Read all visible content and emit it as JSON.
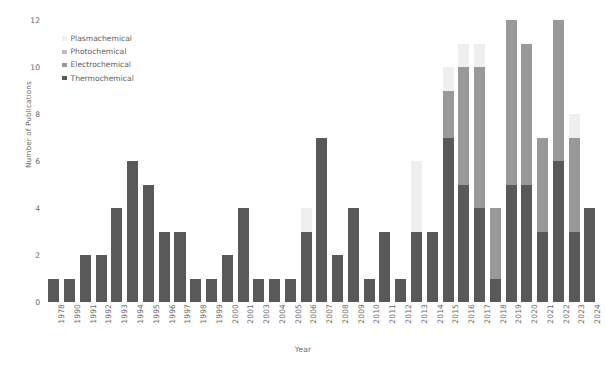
{
  "chart_data": {
    "type": "bar",
    "subtype": "stacked-vertical",
    "title": "",
    "xlabel": "Year",
    "ylabel": "Number of Publications",
    "ylim": [
      0,
      12
    ],
    "yticks": [
      0,
      2,
      4,
      6,
      8,
      10,
      12
    ],
    "grid": false,
    "legend_position": "upper-left-inside",
    "categories": [
      "1978",
      "1990",
      "1991",
      "1992",
      "1993",
      "1994",
      "1995",
      "1996",
      "1997",
      "1998",
      "1999",
      "2000",
      "2001",
      "2003",
      "2004",
      "2005",
      "2006",
      "2007",
      "2008",
      "2009",
      "2010",
      "2011",
      "2012",
      "2013",
      "2014",
      "2015",
      "2016",
      "2017",
      "2018",
      "2019",
      "2020",
      "2021",
      "2022",
      "2023",
      "2024"
    ],
    "series": [
      {
        "name": "Thermochemical",
        "color": "#595959",
        "values": [
          1,
          1,
          2,
          2,
          4,
          6,
          5,
          3,
          3,
          1,
          1,
          2,
          4,
          1,
          1,
          1,
          3,
          7,
          2,
          4,
          1,
          3,
          1,
          3,
          3,
          7,
          5,
          4,
          1,
          5,
          5,
          3,
          6,
          3,
          4
        ]
      },
      {
        "name": "Electrochemical",
        "color": "#999999",
        "values": [
          0,
          0,
          0,
          0,
          0,
          0,
          0,
          0,
          0,
          0,
          0,
          0,
          0,
          0,
          0,
          0,
          0,
          0,
          0,
          0,
          0,
          0,
          0,
          0,
          0,
          2,
          5,
          6,
          3,
          7,
          6,
          4,
          6,
          4,
          0
        ]
      },
      {
        "name": "Photochemical",
        "color": "#bdbdbd",
        "values": [
          0,
          0,
          0,
          0,
          0,
          0,
          0,
          0,
          0,
          0,
          0,
          0,
          0,
          0,
          0,
          0,
          0,
          0,
          0,
          0,
          0,
          0,
          0,
          0,
          0,
          0,
          0,
          0,
          0,
          0,
          0,
          0,
          0,
          0,
          0
        ]
      },
      {
        "name": "Plasmachemical",
        "color": "#efefef",
        "values": [
          0,
          0,
          0,
          0,
          0,
          0,
          0,
          0,
          0,
          0,
          0,
          0,
          0,
          0,
          0,
          0,
          1,
          0,
          0,
          0,
          0,
          0,
          0,
          3,
          0,
          1,
          1,
          1,
          0,
          0,
          0,
          0,
          0,
          1,
          0
        ]
      }
    ],
    "totals": [
      1,
      1,
      2,
      2,
      4,
      6,
      5,
      3,
      3,
      1,
      1,
      2,
      4,
      1,
      1,
      1,
      4,
      7,
      2,
      4,
      1,
      3,
      1,
      6,
      3,
      10,
      11,
      11,
      4,
      12,
      11,
      7,
      12,
      8,
      4
    ]
  },
  "legend": {
    "entries": [
      {
        "label": "Plasmachemical",
        "color": "#efefef"
      },
      {
        "label": "Photochemical",
        "color": "#bdbdbd"
      },
      {
        "label": "Electrochemical",
        "color": "#999999"
      },
      {
        "label": "Thermochemical",
        "color": "#595959"
      }
    ]
  },
  "axes": {
    "y_title": "Number of Publications",
    "x_title": "Year"
  }
}
